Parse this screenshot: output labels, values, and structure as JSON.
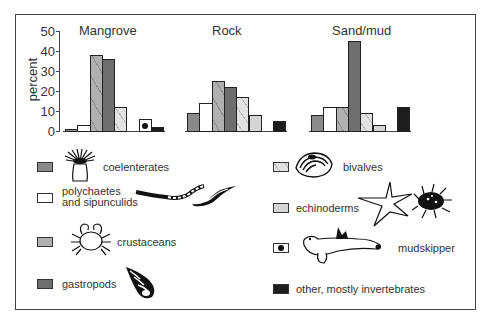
{
  "chart_data": {
    "type": "bar",
    "title": "",
    "xlabel": "",
    "ylabel": "percent",
    "ylim": [
      0,
      50
    ],
    "yticks": [
      0,
      10,
      20,
      30,
      40,
      50
    ],
    "grid": false,
    "legend_position": "bottom",
    "categories": [
      "Mangrove",
      "Rock",
      "Sand/mud"
    ],
    "series": [
      {
        "name": "coelenterates",
        "color": "#8a8a8a",
        "values": [
          1,
          9,
          8
        ]
      },
      {
        "name": "polychaetes and sipunculids",
        "color": "#ffffff",
        "values": [
          3,
          14,
          12
        ]
      },
      {
        "name": "crustaceans",
        "color": "#b0b0b0",
        "values": [
          38,
          25,
          12
        ]
      },
      {
        "name": "gastropods",
        "color": "#6e6e6e",
        "values": [
          36,
          22,
          45
        ]
      },
      {
        "name": "bivalves",
        "color": "#e2e2e2",
        "values": [
          12,
          17,
          9
        ]
      },
      {
        "name": "echinoderms",
        "color": "#d4d4d4",
        "values": [
          0,
          8,
          3
        ]
      },
      {
        "name": "mudskipper",
        "color": "#ffffff",
        "values": [
          6,
          0,
          0
        ]
      },
      {
        "name": "other, mostly invertebrates",
        "color": "#1e1e1e",
        "values": [
          2,
          5,
          12
        ]
      }
    ]
  },
  "axis": {
    "ylabel": "percent",
    "ticks": [
      "0",
      "10",
      "20",
      "30",
      "40",
      "50"
    ]
  },
  "groups": {
    "mangrove": "Mangrove",
    "rock": "Rock",
    "sand": "Sand/mud"
  },
  "legend": {
    "coelenterates": "coelenterates",
    "polychaetes_line1": "polychaetes",
    "polychaetes_line2": "and sipunculids",
    "crustaceans": "crustaceans",
    "gastropods": "gastropods",
    "bivalves": "bivalves",
    "echinoderms": "echinoderms",
    "mudskipper": "mudskipper",
    "other": "other, mostly invertebrates"
  }
}
